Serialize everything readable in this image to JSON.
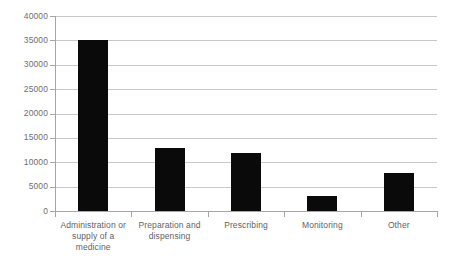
{
  "chart_data": {
    "type": "bar",
    "title": "",
    "xlabel": "",
    "ylabel": "",
    "categories": [
      "Administration or supply of a medicine",
      "Preparation and dispensing",
      "Prescribing",
      "Monitoring",
      "Other"
    ],
    "values": [
      35000,
      13000,
      12000,
      3000,
      7800
    ],
    "ylim": [
      0,
      40000
    ],
    "yticks": [
      0,
      5000,
      10000,
      15000,
      20000,
      25000,
      30000,
      35000,
      40000
    ],
    "ytick_labels": [
      "0",
      "5000",
      "10000",
      "15000",
      "20000",
      "25000",
      "30000",
      "35000",
      "40000"
    ],
    "grid": true,
    "legend": false,
    "bar_color": "#0a0a0a",
    "gridline_color": "#c8c8c8",
    "axis_color": "#a6a6a6",
    "label_color": "#5f5f5f",
    "background": "#ffffff"
  }
}
